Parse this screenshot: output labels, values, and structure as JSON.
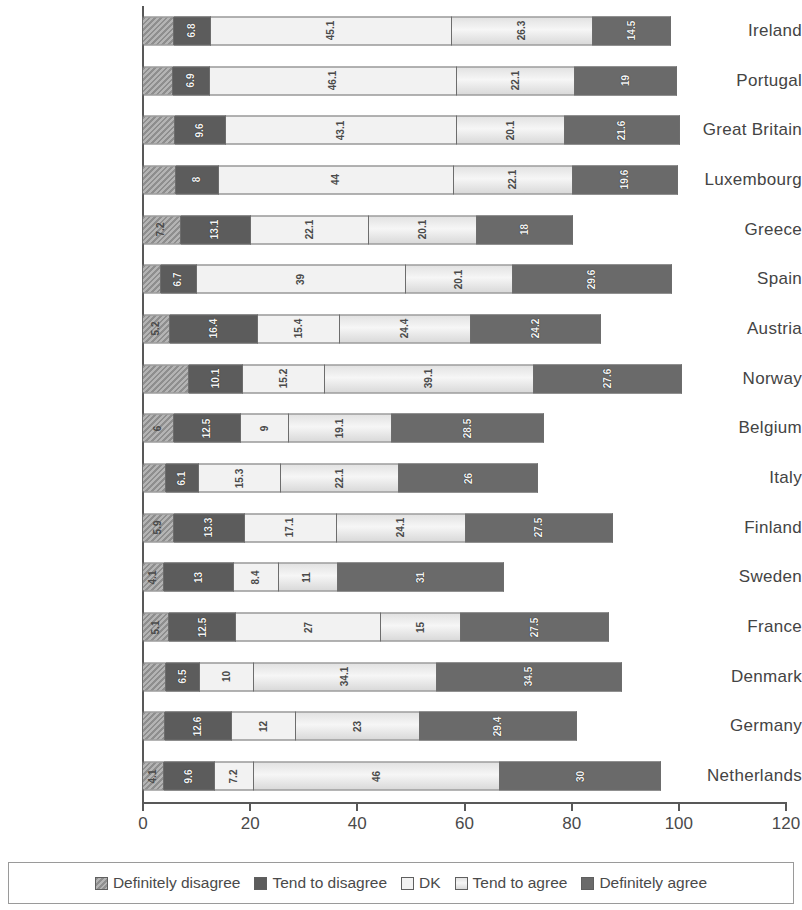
{
  "chart_data": {
    "type": "bar",
    "orientation": "horizontal",
    "stacked": true,
    "title": "",
    "xlabel": "",
    "ylabel": "",
    "xlim": [
      0,
      120
    ],
    "xticks": [
      0,
      20,
      40,
      60,
      80,
      100,
      120
    ],
    "grid": false,
    "legend_position": "bottom",
    "legend": [
      "Definitely disagree",
      "Tend to disagree",
      "DK",
      "Tend to agree",
      "Definitely agree"
    ],
    "categories": [
      "Ireland",
      "Portugal",
      "Great Britain",
      "Luxembourg",
      "Greece",
      "Spain",
      "Austria",
      "Norway",
      "Belgium",
      "Italy",
      "Finland",
      "Sweden",
      "France",
      "Denmark",
      "Germany",
      "Netherlands"
    ],
    "series": [
      {
        "name": "Definitely disagree",
        "values": [
          6.0,
          5.8,
          6.1,
          6.3,
          7.2,
          3.5,
          5.2,
          8.8,
          6.0,
          4.5,
          5.9,
          4.1,
          5.1,
          4.4,
          4.2,
          4.1
        ]
      },
      {
        "name": "Tend to disagree",
        "values": [
          6.8,
          6.9,
          9.6,
          8.0,
          13.1,
          6.7,
          16.4,
          10.1,
          12.5,
          6.1,
          13.3,
          13.0,
          12.5,
          6.5,
          12.6,
          9.6
        ]
      },
      {
        "name": "DK",
        "values": [
          45.1,
          46.1,
          43.1,
          44.0,
          22.1,
          39.0,
          15.4,
          15.2,
          9.0,
          15.3,
          17.1,
          8.4,
          27.0,
          10.0,
          12.0,
          7.2
        ]
      },
      {
        "name": "Tend to agree",
        "values": [
          26.3,
          22.1,
          20.1,
          22.1,
          20.1,
          20.1,
          24.4,
          39.1,
          19.1,
          22.1,
          24.1,
          11.0,
          15.0,
          34.1,
          23.0,
          46.0
        ]
      },
      {
        "name": "Definitely agree",
        "values": [
          14.5,
          19.0,
          21.6,
          19.6,
          18.0,
          29.6,
          24.2,
          27.6,
          28.5,
          26.0,
          27.5,
          31.0,
          27.5,
          34.5,
          29.4,
          30.0
        ]
      }
    ],
    "bar_labels": [
      [
        "",
        "6.8",
        "45.1",
        "26.3",
        "14.5"
      ],
      [
        "",
        "6.9",
        "46.1",
        "22.1",
        "19"
      ],
      [
        "",
        "9.6",
        "43.1",
        "20.1",
        "21.6"
      ],
      [
        "",
        "8",
        "44",
        "22.1",
        "19.6"
      ],
      [
        "7.2",
        "13.1",
        "22.1",
        "20.1",
        "18"
      ],
      [
        "",
        "6.7",
        "39",
        "20.1",
        "29.6"
      ],
      [
        "5.2",
        "16.4",
        "15.4",
        "24.4",
        "24.2"
      ],
      [
        "",
        "10.1",
        "15.2",
        "39.1",
        "27.6"
      ],
      [
        "6",
        "12.5",
        "9",
        "19.1",
        "28.5"
      ],
      [
        "",
        "6.1",
        "15.3",
        "22.1",
        "26"
      ],
      [
        "5.9",
        "13.3",
        "17.1",
        "24.1",
        "27.5"
      ],
      [
        "4.1",
        "13",
        "8.4",
        "11",
        "31"
      ],
      [
        "5.1",
        "12.5",
        "27",
        "15",
        "27.5"
      ],
      [
        "",
        "6.5",
        "10",
        "34.1",
        "34.5"
      ],
      [
        "",
        "12.6",
        "12",
        "23",
        "29.4"
      ],
      [
        "4.1",
        "9.6",
        "7.2",
        "46",
        "30"
      ]
    ],
    "colors": {
      "definitely_disagree": "#a0a0a0",
      "tend_to_disagree": "#5c5c5c",
      "dk": "#f2f2f2",
      "tend_to_agree": "#e4e4e4",
      "definitely_agree": "#6a6a6a",
      "axis": "#585858",
      "text": "#4a4a4a"
    }
  }
}
